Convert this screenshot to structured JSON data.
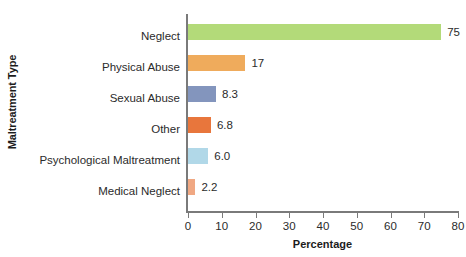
{
  "chart_data": {
    "type": "bar",
    "orientation": "horizontal",
    "title": "",
    "xlabel": "Percentage",
    "ylabel": "Maltreatment Type",
    "xlim": [
      0,
      80
    ],
    "xticks": [
      0,
      10,
      20,
      30,
      40,
      50,
      60,
      70,
      80
    ],
    "xtick_labels": [
      "0",
      "10",
      "20",
      "30",
      "40",
      "50",
      "60",
      "70",
      "80"
    ],
    "grid": false,
    "legend": false,
    "categories": [
      "Neglect",
      "Physical Abuse",
      "Sexual Abuse",
      "Other",
      "Psychological Maltreatment",
      "Medical Neglect"
    ],
    "values": [
      75,
      17,
      8.3,
      6.8,
      6.0,
      2.2
    ],
    "value_labels": [
      "75",
      "17",
      "8.3",
      "6.8",
      "6.0",
      "2.2"
    ],
    "bar_colors": [
      "#b3da79",
      "#efab5c",
      "#8395bd",
      "#e8763c",
      "#b1d8e8",
      "#f0a883"
    ],
    "axis_color": "#7a7a7a",
    "text_color": "#2b2b2b"
  }
}
